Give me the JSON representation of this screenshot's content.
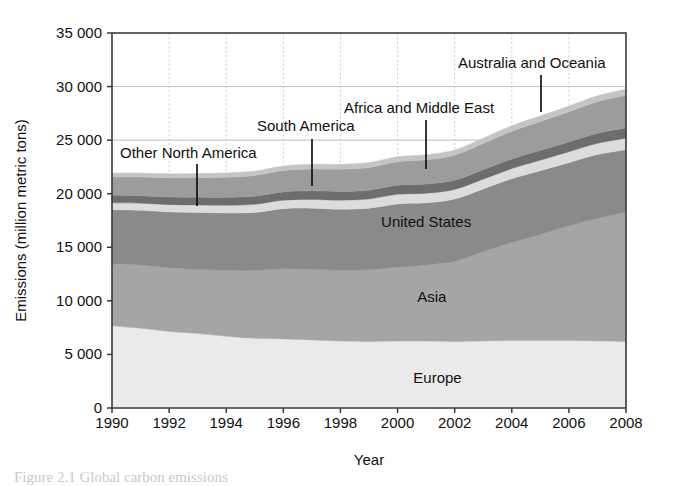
{
  "figure": {
    "caption_fragment": "Figure 2.1 Global carbon emissions",
    "bg_color": "#ffffff"
  },
  "axes": {
    "y_title": "Emissions (million metric tons)",
    "x_title": "Year",
    "y_ticks": [
      "0",
      "5 000",
      "10 000",
      "15 000",
      "20 000",
      "25 000",
      "30 000",
      "35 000"
    ],
    "y_tick_values": [
      0,
      5000,
      10000,
      15000,
      20000,
      25000,
      30000,
      35000
    ],
    "x_ticks": [
      "1990",
      "1992",
      "1994",
      "1996",
      "1998",
      "2000",
      "2002",
      "2004",
      "2006",
      "2008"
    ],
    "x_tick_values": [
      1990,
      1992,
      1994,
      1996,
      1998,
      2000,
      2002,
      2004,
      2006,
      2008
    ],
    "y_min": 0,
    "y_max": 35000,
    "x_min": 1990,
    "x_max": 2008
  },
  "inline_labels": [
    {
      "text": "United States",
      "x": 2001.0,
      "y": 16900
    },
    {
      "text": "Asia",
      "x": 2001.2,
      "y": 9900
    },
    {
      "text": "Europe",
      "x": 2001.4,
      "y": 2300
    }
  ],
  "callouts": [
    {
      "text": "Other North America",
      "label_x": 120,
      "label_y": 158,
      "leader_x": 197,
      "leader_y1": 164,
      "leader_y2": 206
    },
    {
      "text": "South America",
      "label_x": 257,
      "label_y": 131,
      "leader_x": 312,
      "leader_y1": 139,
      "leader_y2": 186
    },
    {
      "text": "Africa and Middle East",
      "label_x": 344,
      "label_y": 113,
      "leader_x": 426,
      "leader_y1": 120,
      "leader_y2": 169
    },
    {
      "text": "Australia and Oceania",
      "label_x": 458,
      "label_y": 68,
      "leader_x": 541,
      "leader_y1": 75,
      "leader_y2": 112
    }
  ],
  "chart_data": {
    "type": "area",
    "title": "",
    "xlabel": "Year",
    "ylabel": "Emissions (million metric tons)",
    "xlim": [
      1990,
      2008
    ],
    "ylim": [
      0,
      35000
    ],
    "grid": true,
    "stacked": true,
    "legend_position": "inline-annotations",
    "x": [
      1990,
      1991,
      1992,
      1993,
      1994,
      1995,
      1996,
      1997,
      1998,
      1999,
      2000,
      2001,
      2002,
      2003,
      2004,
      2005,
      2006,
      2007,
      2008
    ],
    "series": [
      {
        "name": "Europe",
        "color": "#eaeaea",
        "values": [
          7650,
          7450,
          7150,
          6950,
          6700,
          6500,
          6450,
          6350,
          6250,
          6200,
          6250,
          6250,
          6200,
          6250,
          6300,
          6300,
          6300,
          6250,
          6200
        ]
      },
      {
        "name": "Asia",
        "color": "#a5a5a5",
        "values": [
          5800,
          5900,
          5950,
          6000,
          6150,
          6350,
          6550,
          6600,
          6600,
          6700,
          6900,
          7100,
          7500,
          8350,
          9150,
          9900,
          10700,
          11450,
          12100
        ]
      },
      {
        "name": "United States",
        "color": "#8a8a8a",
        "values": [
          5050,
          5100,
          5200,
          5300,
          5350,
          5400,
          5600,
          5700,
          5700,
          5750,
          5900,
          5800,
          5800,
          5850,
          5950,
          5950,
          5900,
          5950,
          5800
        ]
      },
      {
        "name": "South America",
        "color": "#dcdcdc",
        "values": [
          650,
          660,
          680,
          700,
          720,
          760,
          790,
          820,
          850,
          860,
          890,
          900,
          900,
          910,
          950,
          980,
          1010,
          1050,
          1080
        ]
      },
      {
        "name": "Other North America",
        "color": "#6d6d6d",
        "values": [
          700,
          700,
          710,
          720,
          740,
          760,
          780,
          800,
          810,
          820,
          850,
          850,
          860,
          880,
          900,
          910,
          920,
          940,
          950
        ]
      },
      {
        "name": "Africa and Middle East",
        "color": "#9c9c9c",
        "values": [
          1700,
          1740,
          1780,
          1820,
          1870,
          1930,
          1990,
          2040,
          2080,
          2120,
          2200,
          2260,
          2330,
          2450,
          2580,
          2700,
          2820,
          2950,
          3050
        ]
      },
      {
        "name": "Australia and Oceania",
        "color": "#c4c4c4",
        "values": [
          380,
          385,
          390,
          400,
          410,
          420,
          430,
          440,
          450,
          460,
          470,
          480,
          490,
          505,
          520,
          530,
          545,
          560,
          570
        ]
      }
    ],
    "totals": [
      21930,
      21935,
      21860,
      21890,
      21940,
      22120,
      22590,
      22750,
      22740,
      22910,
      23460,
      23640,
      24080,
      25195,
      26350,
      27270,
      28195,
      29150,
      29750
    ]
  },
  "geometry": {
    "plot_left": 112,
    "plot_right": 626,
    "plot_top": 33,
    "plot_bottom": 408
  }
}
